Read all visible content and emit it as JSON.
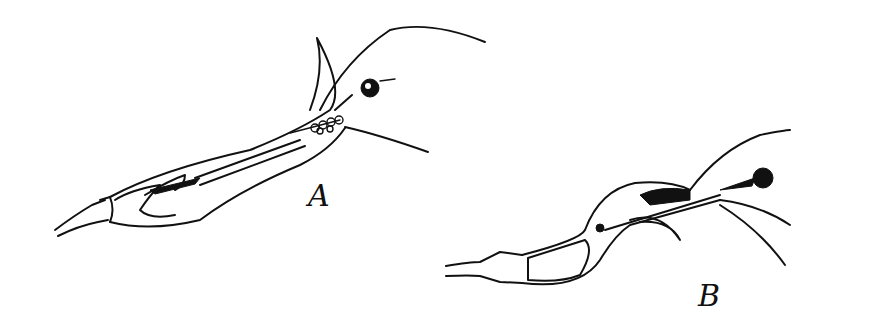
{
  "figure": {
    "panels": [
      {
        "label": "A",
        "description": "straight elongated organ with head and eye"
      },
      {
        "label": "B",
        "description": "bent elongated organ with head and eye"
      }
    ]
  }
}
